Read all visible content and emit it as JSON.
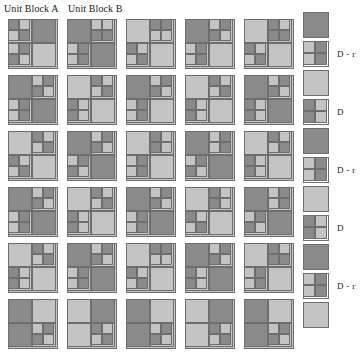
{
  "figure": {
    "headings": [
      {
        "id": "unit-block-a",
        "text": "Unit Block A"
      },
      {
        "id": "unit-block-b",
        "text": "Unit Block B"
      }
    ],
    "colors": {
      "dark": "#8a8a8a",
      "light": "#c4c4c4",
      "line": "#6e6e6e",
      "background": "#ffffff",
      "text": "#1a1a1a"
    },
    "grid": {
      "rows": 6,
      "columns": 5,
      "block_size_px": 50,
      "column_step_px": 59,
      "row_step_px": 56,
      "last_row_clipped": true
    },
    "tone_key": {
      "0": "light",
      "1": "dark"
    },
    "blocks": [
      [
        {
          "tl": "1,0,0,1",
          "tr": "1",
          "bl": "0,1,1,0",
          "br": "0"
        },
        {
          "tl": "1",
          "tr": "0,0,1,1",
          "bl": "0,1,0,1",
          "br": "1"
        },
        {
          "tl": "0",
          "tr": "1,1,0,0",
          "bl": "1,0,0,1",
          "br": "0"
        },
        {
          "tl": "1",
          "tr": "0,1,1,0",
          "bl": "0,1,0,1",
          "br": "0"
        },
        {
          "tl": "0",
          "tr": "1,0,1,1",
          "bl": "1,0,0,1",
          "br": "0"
        }
      ],
      [
        {
          "tl": "1",
          "tr": "0,1,1,0",
          "bl": "0,1,0,1",
          "br": "1"
        },
        {
          "tl": "0",
          "tr": "1,0,0,1",
          "bl": "1,0,1,0",
          "br": "0"
        },
        {
          "tl": "1",
          "tr": "0,1,1,0",
          "bl": "0,1,0,1",
          "br": "0"
        },
        {
          "tl": "0",
          "tr": "1,0,0,1",
          "bl": "1,0,1,0",
          "br": "0"
        },
        {
          "tl": "1",
          "tr": "0,1,1,0",
          "bl": "1,0,1,0",
          "br": "1"
        }
      ],
      [
        {
          "tl": "0",
          "tr": "1,0,0,1",
          "bl": "1,0,0,1",
          "br": "0"
        },
        {
          "tl": "1",
          "tr": "0,1,1,0",
          "bl": "0,1,1,0",
          "br": "1"
        },
        {
          "tl": "0",
          "tr": "1,0,1,0",
          "bl": "0,1,0,1",
          "br": "0"
        },
        {
          "tl": "1",
          "tr": "0,1,0,1",
          "bl": "0,1,1,0",
          "br": "1"
        },
        {
          "tl": "0",
          "tr": "1,0,0,1",
          "bl": "1,0,1,0",
          "br": "0"
        }
      ],
      [
        {
          "tl": "1",
          "tr": "0,1,1,0",
          "bl": "0,1,0,1",
          "br": "1"
        },
        {
          "tl": "0",
          "tr": "1,0,0,1",
          "bl": "1,0,1,0",
          "br": "0"
        },
        {
          "tl": "1",
          "tr": "0,1,1,0",
          "bl": "0,1,0,1",
          "br": "1"
        },
        {
          "tl": "0",
          "tr": "1,0,1,0",
          "bl": "1,0,0,1",
          "br": "0"
        },
        {
          "tl": "1",
          "tr": "0,1,0,1",
          "bl": "0,1,1,0",
          "br": "1"
        }
      ],
      [
        {
          "tl": "0",
          "tr": "1,0,0,1",
          "bl": "1,0,1,0",
          "br": "0"
        },
        {
          "tl": "1",
          "tr": "0,1,1,0",
          "bl": "0,1,0,1",
          "br": "1"
        },
        {
          "tl": "0",
          "tr": "1,1,0,0",
          "bl": "1,0,0,1",
          "br": "0"
        },
        {
          "tl": "1",
          "tr": "0,1,1,0",
          "bl": "1,0,1,0",
          "br": "1"
        },
        {
          "tl": "0",
          "tr": "1,0,1,1",
          "bl": "0,1,0,1",
          "br": "0"
        }
      ],
      [
        {
          "tl": "1",
          "tr": "0",
          "bl": "1",
          "br": "0,1,1,0"
        },
        {
          "tl": "0",
          "tr": "1",
          "bl": "0",
          "br": "1,0,0,1"
        },
        {
          "tl": "1",
          "tr": "0",
          "bl": "1",
          "br": "0,1,1,0"
        },
        {
          "tl": "0",
          "tr": "1",
          "bl": "0",
          "br": "1,0,0,1"
        },
        {
          "tl": "1",
          "tr": "0",
          "bl": "1",
          "br": "0,1,1,0"
        }
      ]
    ],
    "legend": {
      "items": [
        {
          "id": "legend-solid-dark-1",
          "kind": "solid",
          "tone": "1",
          "label": ""
        },
        {
          "id": "legend-quad-d-r-1",
          "kind": "quadrant",
          "tone": "0,1,0,1",
          "label": "D - r"
        },
        {
          "id": "legend-solid-light-1",
          "kind": "solid",
          "tone": "0",
          "label": ""
        },
        {
          "id": "legend-quad-d-1",
          "kind": "quadrant",
          "tone": "1,0,1,0",
          "label": "D"
        },
        {
          "id": "legend-solid-dark-2",
          "kind": "solid",
          "tone": "1",
          "label": ""
        },
        {
          "id": "legend-quad-d-r-2",
          "kind": "quadrant",
          "tone": "0,1,0,1",
          "label": "D - r"
        },
        {
          "id": "legend-solid-light-2",
          "kind": "solid",
          "tone": "0",
          "label": ""
        },
        {
          "id": "legend-quad-d-2",
          "kind": "quadrant",
          "tone": "1,0,1,0",
          "label": "D"
        },
        {
          "id": "legend-solid-dark-3",
          "kind": "solid",
          "tone": "1",
          "label": ""
        },
        {
          "id": "legend-quad-d-r-3",
          "kind": "quadrant",
          "tone": "0,1,0,1",
          "label": "D - r"
        },
        {
          "id": "legend-solid-light-3",
          "kind": "solid",
          "tone": "0",
          "label": ""
        }
      ]
    }
  }
}
